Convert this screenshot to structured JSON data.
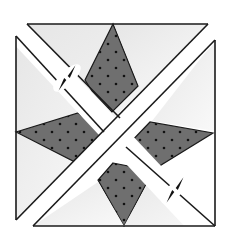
{
  "diagram": {
    "kind": "quilt-block-piecing",
    "colors": {
      "background": "#ffffff",
      "light_patch": "#ececec",
      "light_patch_gradient": "#f8f8f8",
      "star_fill": "#6e6e6e",
      "dot": "#111111",
      "outline": "#1a1a1a",
      "seam_gap": "#ffffff"
    },
    "arrows": [
      {
        "name": "press-arrow-upper-left",
        "icon": "double-arrow-icon"
      },
      {
        "name": "press-arrow-lower-right",
        "icon": "double-arrow-icon"
      }
    ]
  }
}
